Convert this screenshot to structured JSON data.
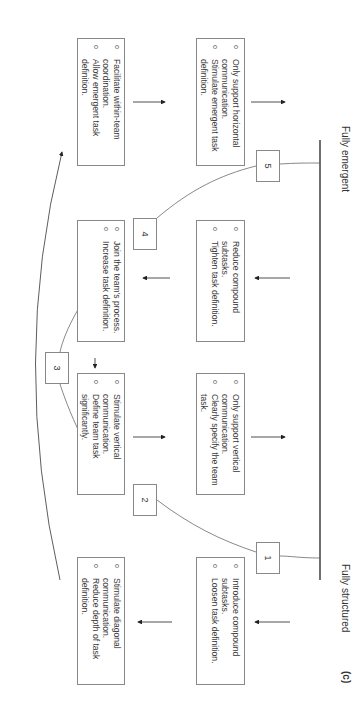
{
  "figure_label": "(c)",
  "axis": {
    "start_label": "Fully structured",
    "end_label": "Fully emergent"
  },
  "stages": [
    {
      "number": "1"
    },
    {
      "number": "2"
    },
    {
      "number": "3"
    },
    {
      "number": "4"
    },
    {
      "number": "5"
    }
  ],
  "upper_boxes": [
    {
      "items": [
        "Stimulate diagonal communication.",
        "Reduce depth of task definition."
      ]
    },
    {
      "items": [
        "Stimulate vertical communication.",
        "Define team task significantly."
      ]
    },
    {
      "items": [
        "Join the team's process.",
        "Increase task definition."
      ]
    },
    {
      "items": [
        "Facilitate within-team coordination.",
        "Allow emergent task definition."
      ]
    }
  ],
  "lower_boxes": [
    {
      "items": [
        "Introduce compound subtasks.",
        "Loosen task definition."
      ]
    },
    {
      "items": [
        "Only support vertical communication.",
        "Clearly specify the team task."
      ]
    },
    {
      "items": [
        "Reduce compound subtasks.",
        "Tighten task definition."
      ]
    },
    {
      "items": [
        "Only support horizontal communication.",
        "Stimulate emergent task definition."
      ]
    }
  ],
  "bullet_glyph": "o"
}
